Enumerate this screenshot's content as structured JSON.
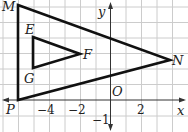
{
  "diagram": {
    "title": "",
    "grid": {
      "x_range": [
        -6,
        4
      ],
      "y_range": [
        -2,
        6
      ],
      "step": 1
    },
    "axes": {
      "x_label": "x",
      "y_label": "y",
      "origin_label": "O",
      "x_ticks": [
        {
          "value": -4,
          "label": "−4"
        },
        {
          "value": -2,
          "label": "−2"
        },
        {
          "value": 2,
          "label": "2"
        }
      ],
      "y_ticks": [
        {
          "value": -1,
          "label": "−1"
        }
      ]
    },
    "points": {
      "M": {
        "label": "M",
        "x": -5,
        "y": 6
      },
      "N": {
        "label": "N",
        "x": 3.9,
        "y": 2.6
      },
      "P": {
        "label": "P",
        "x": -5,
        "y": 0
      },
      "E": {
        "label": "E",
        "x": -4,
        "y": 4
      },
      "F": {
        "label": "F",
        "x": -1,
        "y": 3
      },
      "G": {
        "label": "G",
        "x": -4,
        "y": 2
      }
    },
    "triangles": [
      {
        "name": "MNP",
        "vertices": [
          "M",
          "N",
          "P"
        ]
      },
      {
        "name": "EFG",
        "vertices": [
          "E",
          "F",
          "G"
        ]
      }
    ],
    "colors": {
      "grid": "#c8c8c8",
      "lines": "#111111",
      "axis": "#333333"
    }
  }
}
